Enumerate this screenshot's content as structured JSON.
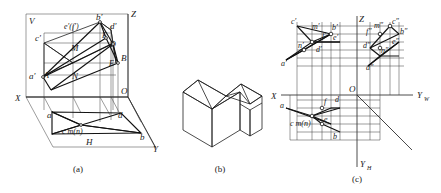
{
  "figure": {
    "captions": [
      {
        "id": "cap-a",
        "text": "(a)"
      },
      {
        "id": "cap-b",
        "text": "(b)"
      },
      {
        "id": "cap-c",
        "text": "(c)"
      }
    ]
  },
  "panel_a": {
    "planes": {
      "vertical_label": "V",
      "horizontal_label": "H"
    },
    "axes": [
      {
        "name": "x-axis",
        "label": "X"
      },
      {
        "name": "y-axis",
        "label": "Y"
      },
      {
        "name": "z-axis",
        "label": "Z"
      },
      {
        "name": "origin",
        "label": "O"
      }
    ],
    "space_points": [
      {
        "name": "point-A",
        "label": "A"
      },
      {
        "name": "point-B",
        "label": "B"
      },
      {
        "name": "point-D",
        "label": "D"
      },
      {
        "name": "point-E",
        "label": "E"
      },
      {
        "name": "point-F",
        "label": "F"
      },
      {
        "name": "point-M",
        "label": "M"
      },
      {
        "name": "point-N",
        "label": "N"
      }
    ],
    "front_projections": [
      {
        "name": "proj-a-prime",
        "label": "a′"
      },
      {
        "name": "proj-b-prime",
        "label": "b′"
      },
      {
        "name": "proj-c-prime",
        "label": "c′"
      },
      {
        "name": "proj-d-prime",
        "label": "d′"
      },
      {
        "name": "proj-ef-prime",
        "label": "e′(f′)"
      }
    ],
    "top_projections": [
      {
        "name": "proj-a",
        "label": "a"
      },
      {
        "name": "proj-b",
        "label": "b"
      },
      {
        "name": "proj-c-mn",
        "label": "c m(n)"
      },
      {
        "name": "proj-d",
        "label": "d"
      }
    ]
  },
  "panel_b": {
    "title": "isometric-solid",
    "description": "L-shaped gabled roof block"
  },
  "panel_c": {
    "axes": [
      {
        "name": "x-axis",
        "label": "X"
      },
      {
        "name": "yw-axis",
        "label": "Y",
        "sub": "W"
      },
      {
        "name": "yh-axis",
        "label": "Y",
        "sub": "H"
      },
      {
        "name": "z-axis",
        "label": "Z"
      },
      {
        "name": "origin",
        "label": "O"
      }
    ],
    "front_view_labels": [
      {
        "name": "label-c-prime",
        "label": "c′"
      },
      {
        "name": "label-m-prime",
        "label": "m′"
      },
      {
        "name": "label-b-prime",
        "label": "b′"
      },
      {
        "name": "label-n-prime",
        "label": "n′"
      },
      {
        "name": "label-f-prime",
        "label": "f′"
      },
      {
        "name": "label-e-prime",
        "label": "e′"
      },
      {
        "name": "label-d-prime",
        "label": "d′"
      },
      {
        "name": "label-a-prime",
        "label": "a′"
      }
    ],
    "side_view_labels": [
      {
        "name": "label-m-dprime",
        "label": "m″"
      },
      {
        "name": "label-n-dprime",
        "label": "n″"
      },
      {
        "name": "label-c-dprime",
        "label": "c″"
      },
      {
        "name": "label-b-dprime",
        "label": "b″"
      },
      {
        "name": "label-f-dprime",
        "label": "f″"
      },
      {
        "name": "label-e-dprime",
        "label": "e″"
      },
      {
        "name": "label-d-dprime",
        "label": "d″"
      },
      {
        "name": "label-a-dprime",
        "label": "a″"
      }
    ],
    "top_view_labels": [
      {
        "name": "label-a",
        "label": "a"
      },
      {
        "name": "label-f",
        "label": "f"
      },
      {
        "name": "label-d",
        "label": "d"
      },
      {
        "name": "label-c-mn",
        "label": "c m(n)"
      },
      {
        "name": "label-e",
        "label": "e"
      },
      {
        "name": "label-b",
        "label": "b"
      }
    ]
  },
  "colors": {
    "ink": "#1a1a1a",
    "thin_line": "#3a3a3a",
    "background": "#ffffff"
  }
}
